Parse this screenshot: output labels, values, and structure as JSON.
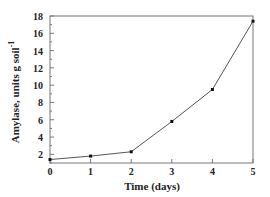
{
  "chart_data": {
    "type": "line",
    "title": "",
    "xlabel": "Time (days)",
    "ylabel": "Amylase, units g soil",
    "ylabel_superscript": "-1",
    "x": [
      0,
      1,
      2,
      3,
      4,
      5
    ],
    "series": [
      {
        "name": "Amylase",
        "values": [
          1.4,
          1.8,
          2.3,
          5.8,
          9.5,
          17.4
        ]
      }
    ],
    "xlim": [
      0,
      5
    ],
    "ylim": [
      1,
      18
    ],
    "xticks": [
      "0",
      "1",
      "2",
      "3",
      "4",
      "5"
    ],
    "yticks": [
      "2",
      "4",
      "6",
      "8",
      "10",
      "12",
      "14",
      "16",
      "18"
    ],
    "grid": false,
    "legend": null
  },
  "colors": {
    "line": "#555555",
    "marker": "#111111",
    "axis": "#777777",
    "text": "#222222"
  }
}
